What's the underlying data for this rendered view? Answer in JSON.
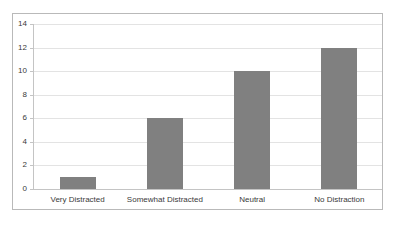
{
  "chart_data": {
    "type": "bar",
    "title": "",
    "subtitle": "",
    "xlabel": "",
    "ylabel": "",
    "categories": [
      "Very Distracted",
      "Somewhat Distracted",
      "Neutral",
      "No Distraction"
    ],
    "values": [
      1,
      6,
      10,
      12
    ],
    "ylim": [
      0,
      14
    ],
    "yticks": [
      0,
      2,
      4,
      6,
      8,
      10,
      12,
      14
    ],
    "ytick_labels": [
      "0",
      "2",
      "4",
      "6",
      "8",
      "10",
      "12",
      "14"
    ],
    "grid": true,
    "grid_axis": "y",
    "legend": false,
    "legend_position": "none",
    "annotations": [],
    "series": [
      {
        "name": "",
        "values": [
          1,
          6,
          10,
          12
        ]
      }
    ]
  },
  "style": {
    "bar_color": "#808080",
    "gridline_color": "#e3e3e3",
    "axis_color": "#c4c4c4",
    "frame_color": "#b9b9b9",
    "text_color": "#3a3a3a",
    "background_color": "#ffffff"
  }
}
